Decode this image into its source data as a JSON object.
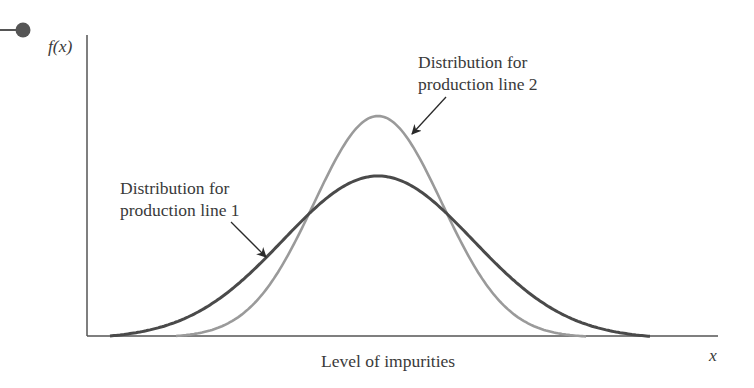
{
  "chart_data": {
    "type": "line",
    "title": "",
    "xlabel": "Level of impurities",
    "ylabel": "f(x)",
    "x_axis_symbol": "x",
    "grid": false,
    "ticks": false,
    "series": [
      {
        "name": "Distribution for production line 1",
        "shape": "normal",
        "relative_mean": 0.5,
        "relative_spread": "wider",
        "relative_peak_height": 0.62,
        "color": "#4a4a4a",
        "annotation": "Distribution for production line 1"
      },
      {
        "name": "Distribution for production line 2",
        "shape": "normal",
        "relative_mean": 0.5,
        "relative_spread": "narrower",
        "relative_peak_height": 0.85,
        "color": "#9a9a9a",
        "annotation": "Distribution for production line 2"
      }
    ]
  },
  "labels": {
    "y_axis": "f(x)",
    "x_axis": "x",
    "x_title": "Level of impurities",
    "line1_a": "Distribution for",
    "line1_b": "production line 1",
    "line2_a": "Distribution for",
    "line2_b": "production line 2"
  },
  "colors": {
    "axis": "#555555",
    "line1": "#4a4a4a",
    "line2": "#9a9a9a",
    "arrow": "#2a2a2a",
    "bullet": "#555555"
  }
}
